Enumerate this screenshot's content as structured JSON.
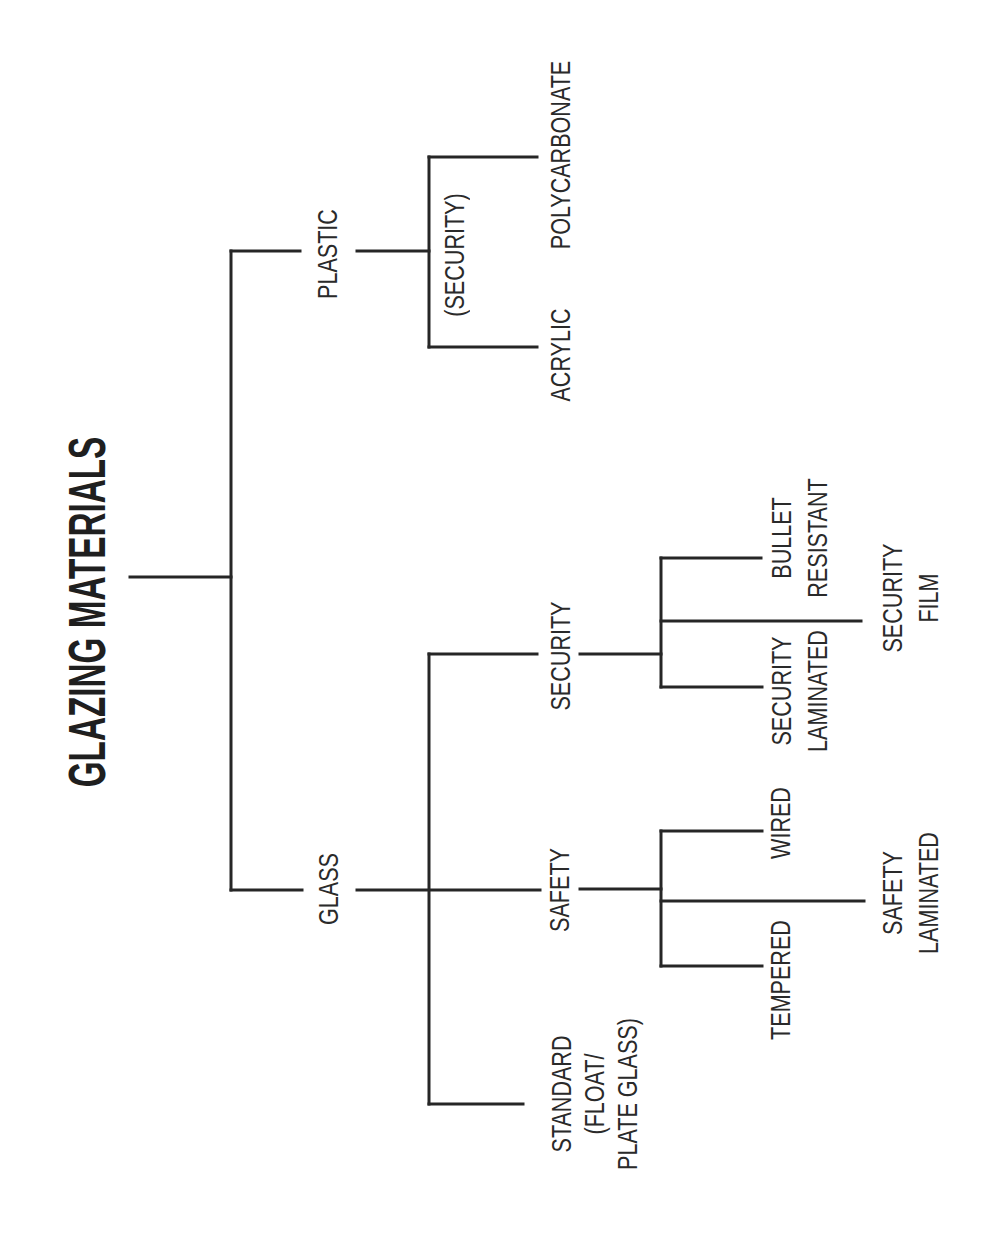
{
  "title": "GLAZING MATERIALS",
  "tree": {
    "root": "GLAZING MATERIALS",
    "children": [
      {
        "label": "PLASTIC",
        "group_note": "(SECURITY)",
        "children": [
          {
            "label": "POLYCARBONATE"
          },
          {
            "label": "ACRYLIC"
          }
        ]
      },
      {
        "label": "GLASS",
        "children": [
          {
            "label": "SECURITY",
            "children": [
              {
                "lines": [
                  "BULLET",
                  "RESISTANT"
                ]
              },
              {
                "lines": [
                  "SECURITY",
                  "FILM"
                ]
              },
              {
                "lines": [
                  "SECURITY",
                  "LAMINATED"
                ]
              }
            ]
          },
          {
            "label": "SAFETY",
            "children": [
              {
                "lines": [
                  "WIRED"
                ]
              },
              {
                "lines": [
                  "SAFETY",
                  "LAMINATED"
                ]
              },
              {
                "lines": [
                  "TEMPERED"
                ]
              }
            ]
          },
          {
            "lines": [
              "STANDARD",
              "(FLOAT/",
              "PLATE GLASS)"
            ]
          }
        ]
      }
    ]
  },
  "colors": {
    "line": "#262626",
    "text": "#2a2a2a",
    "background": "#ffffff"
  }
}
